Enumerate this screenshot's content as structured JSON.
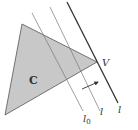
{
  "diagram": {
    "type": "geometry",
    "colors": {
      "region_fill": "#c8c8c8",
      "region_stroke": "#555555",
      "line_thin": "#777777",
      "line_bold": "#333333",
      "label": "#333333"
    },
    "region": {
      "label": "C",
      "vertices": [
        [
          22,
          24
        ],
        [
          5,
          115
        ],
        [
          97,
          62
        ]
      ]
    },
    "vertex": {
      "label": "V",
      "point": [
        97,
        62
      ]
    },
    "lines": [
      {
        "id": "l0",
        "label": "l",
        "subscript": "0",
        "from": [
          32,
          13
        ],
        "to": [
          83,
          111
        ]
      },
      {
        "id": "l-mid",
        "label": "l",
        "subscript": "",
        "from": [
          50,
          7
        ],
        "to": [
          100,
          111
        ]
      },
      {
        "id": "l-support",
        "label": "l",
        "subscript": "",
        "from": [
          67,
          2
        ],
        "to": [
          118,
          103
        ]
      }
    ],
    "arrow": {
      "from": [
        82,
        89
      ],
      "to": [
        98,
        82
      ]
    }
  }
}
